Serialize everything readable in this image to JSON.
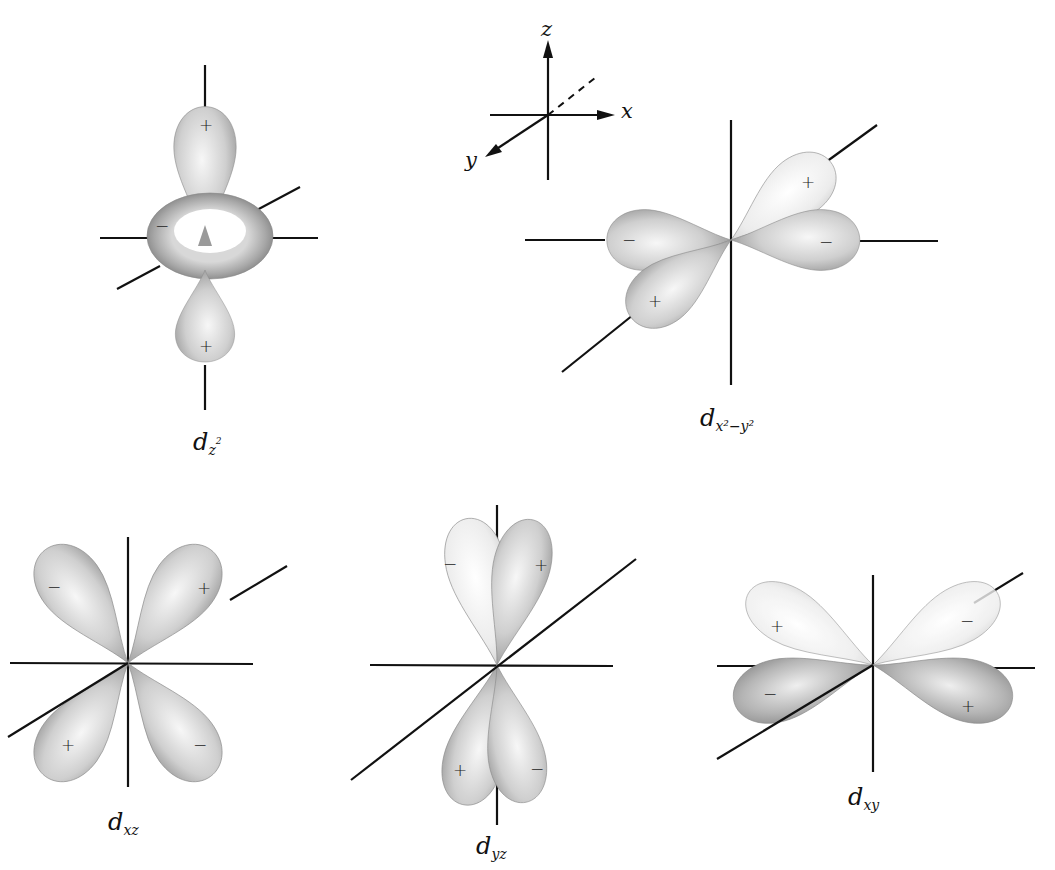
{
  "figure": {
    "reference_axes": {
      "z": "z",
      "x": "x",
      "y": "y"
    },
    "colors": {
      "axis": "#111111",
      "lobe_light": "#f4f4f4",
      "lobe_mid": "#c9c9c9",
      "lobe_dark": "#8f8f8f",
      "background": "#ffffff"
    },
    "orbitals": [
      {
        "id": "dz2",
        "symbol": "d",
        "subscript": "z",
        "superscript": "2",
        "signs": [
          "+",
          "−",
          "+"
        ]
      },
      {
        "id": "dx2y2",
        "symbol": "d",
        "subscript": "x²−y²",
        "signs": [
          "+",
          "−",
          "−",
          "+"
        ]
      },
      {
        "id": "dxz",
        "symbol": "d",
        "subscript": "xz",
        "signs": [
          "−",
          "+",
          "+",
          "−"
        ]
      },
      {
        "id": "dyz",
        "symbol": "d",
        "subscript": "yz",
        "signs": [
          "−",
          "+",
          "+",
          "−"
        ]
      },
      {
        "id": "dxy",
        "symbol": "d",
        "subscript": "xy",
        "signs": [
          "+",
          "−",
          "−",
          "+"
        ]
      }
    ]
  }
}
